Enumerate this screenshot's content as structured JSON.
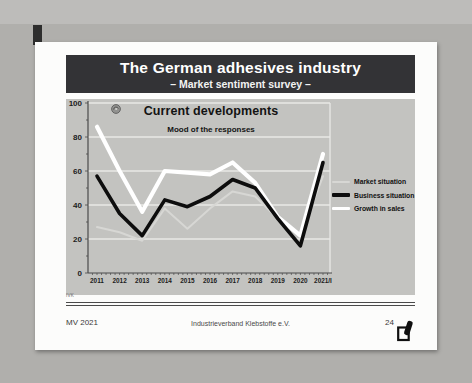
{
  "slide": {
    "title": "The German adhesives industry",
    "subtitle": "– Market sentiment survey –",
    "footer": {
      "note": "IVK",
      "left": "MV 2021",
      "center": "Industrieverband Klebstoffe e.V.",
      "page_number": "24"
    }
  },
  "chart_data": {
    "type": "line",
    "title": "Current developments",
    "subtitle": "Mood of the responses",
    "categories": [
      "2011",
      "2012",
      "2013",
      "2014",
      "2015",
      "2016",
      "2017",
      "2018",
      "2019",
      "2020",
      "2021/I"
    ],
    "series": [
      {
        "name": "Market situation",
        "color": "#d7d7d4",
        "width": 2,
        "values": [
          27,
          24,
          19,
          38,
          26,
          38,
          48,
          45,
          32,
          22,
          57
        ]
      },
      {
        "name": "Business situation",
        "color": "#0d0d0d",
        "width": 3.6,
        "values": [
          57,
          35,
          22,
          43,
          39,
          45,
          55,
          50,
          32,
          16,
          65
        ]
      },
      {
        "name": "Growth in sales",
        "color": "#ffffff",
        "width": 4.2,
        "values": [
          86,
          60,
          36,
          60,
          59,
          58,
          65,
          53,
          33,
          22,
          70
        ]
      }
    ],
    "z_order": [
      0,
      2,
      1
    ],
    "ylim": [
      0,
      100
    ],
    "yticks": [
      0,
      20,
      40,
      60,
      80,
      100
    ],
    "grid": true,
    "legend_position": "right",
    "plot_bg": "#c3c3c0",
    "grid_color": "#e9e9e6",
    "axis_color": "#4a4a4a"
  },
  "colors": {
    "title_bar": "#333336",
    "page_bg": "#b0afac",
    "slide_bg": "#fcfcfb"
  }
}
